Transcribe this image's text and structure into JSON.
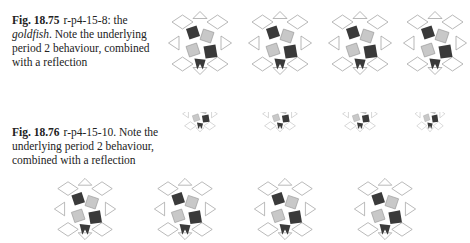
{
  "figures": [
    {
      "label": "Fig. 18.75",
      "caption_pre": "r-p4-15-8: the ",
      "caption_em": "goldfish",
      "caption_post": ". Note the underlying period 2 behaviour, combined with a reflection",
      "panels": 4
    },
    {
      "label": "Fig. 18.76",
      "caption_pre": "r-p4-15-10. Note the underlying period 2 behaviour, combined with a reflection",
      "panels": 4
    }
  ],
  "bottom_row": {
    "panels": 4
  },
  "colors": {
    "dark": "#3a3a3a",
    "light": "#c8c8c8",
    "line": "#9a9a9a",
    "bg": "#ffffff"
  }
}
